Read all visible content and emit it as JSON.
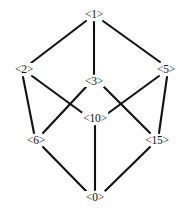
{
  "diagram": {
    "type": "lattice-graph",
    "width": 186,
    "height": 208,
    "background_color": "#ffffff",
    "edge_color": "#111111",
    "label_color": "#111111",
    "nodes": [
      {
        "id": "n1",
        "label": "<1>",
        "x": 94,
        "y": 14
      },
      {
        "id": "n2",
        "label": "<2>",
        "x": 24,
        "y": 69
      },
      {
        "id": "n5",
        "label": "<5>",
        "x": 166,
        "y": 69
      },
      {
        "id": "n3",
        "label": "<3>",
        "x": 94,
        "y": 81
      },
      {
        "id": "n10",
        "label": "<10>",
        "x": 95,
        "y": 118
      },
      {
        "id": "n6",
        "label": "<6>",
        "x": 36,
        "y": 140
      },
      {
        "id": "n15",
        "label": "<15>",
        "x": 157,
        "y": 140
      },
      {
        "id": "n0",
        "label": "<0>",
        "x": 95,
        "y": 197
      }
    ],
    "edges": [
      {
        "from": "n1",
        "to": "n2",
        "x1": 86,
        "y1": 21,
        "x2": 31,
        "y2": 63
      },
      {
        "from": "n1",
        "to": "n3",
        "x1": 94,
        "y1": 22,
        "x2": 94,
        "y2": 74
      },
      {
        "from": "n1",
        "to": "n5",
        "x1": 103,
        "y1": 21,
        "x2": 160,
        "y2": 62
      },
      {
        "from": "n2",
        "to": "n6",
        "x1": 23,
        "y1": 77,
        "x2": 34,
        "y2": 133
      },
      {
        "from": "n2",
        "to": "n10",
        "x1": 32,
        "y1": 76,
        "x2": 84,
        "y2": 114
      },
      {
        "from": "n3",
        "to": "n6",
        "x1": 86,
        "y1": 87,
        "x2": 43,
        "y2": 133
      },
      {
        "from": "n3",
        "to": "n15",
        "x1": 104,
        "y1": 87,
        "x2": 150,
        "y2": 133
      },
      {
        "from": "n5",
        "to": "n10",
        "x1": 159,
        "y1": 76,
        "x2": 107,
        "y2": 114
      },
      {
        "from": "n5",
        "to": "n15",
        "x1": 167,
        "y1": 77,
        "x2": 159,
        "y2": 133
      },
      {
        "from": "n6",
        "to": "n0",
        "x1": 43,
        "y1": 147,
        "x2": 86,
        "y2": 191
      },
      {
        "from": "n10",
        "to": "n0",
        "x1": 95,
        "y1": 126,
        "x2": 95,
        "y2": 190
      },
      {
        "from": "n15",
        "to": "n0",
        "x1": 150,
        "y1": 147,
        "x2": 105,
        "y2": 191
      }
    ]
  }
}
